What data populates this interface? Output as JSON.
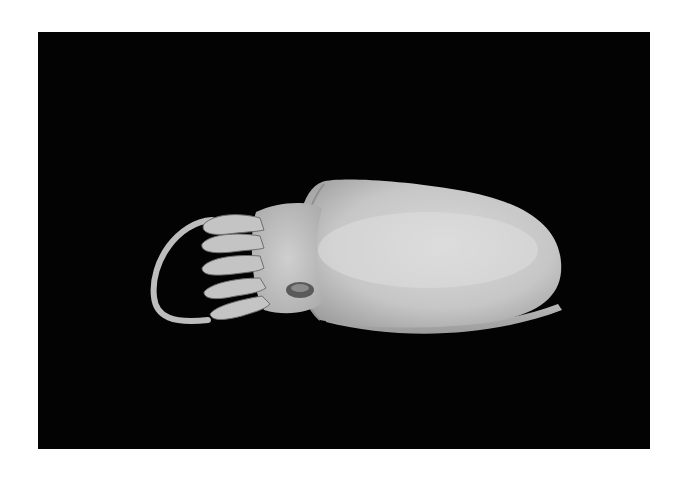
{
  "image": {
    "subject": "cuttlefish",
    "alt": "Photograph of a preserved cuttlefish specimen viewed from above on a black background",
    "background_color": "#030303",
    "page_color": "#ffffff",
    "specimen_color": "#c9c9c9"
  }
}
